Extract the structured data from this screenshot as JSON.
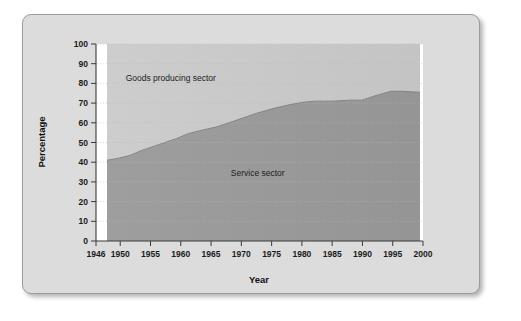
{
  "figure": {
    "panel_background": "#dcdcdc",
    "panel_border": "#9b9b9b",
    "page_background": "#ffffff"
  },
  "chart_data": {
    "type": "area",
    "stacked": true,
    "title": "",
    "subtitle": "",
    "xlabel": "Year",
    "ylabel": "Percentage",
    "xlim": [
      1946,
      2000
    ],
    "ylim": [
      0,
      100
    ],
    "grid": true,
    "grid_style": "dotted-horizontal",
    "legend_position": "inline-annotations",
    "plot_background": "#c9c9c9",
    "x": [
      1946,
      1948,
      1950,
      1952,
      1955,
      1958,
      1960,
      1962,
      1965,
      1968,
      1970,
      1972,
      1975,
      1978,
      1980,
      1982,
      1985,
      1988,
      1990,
      1992,
      1995,
      1997,
      2000
    ],
    "xticks": [
      1946,
      1950,
      1955,
      1960,
      1965,
      1970,
      1975,
      1980,
      1985,
      1990,
      1995,
      2000
    ],
    "xticklabels": [
      "1946",
      "1950",
      "1955",
      "1960",
      "1965",
      "1970",
      "1975",
      "1980",
      "1985",
      "1990",
      "1995",
      "2000"
    ],
    "yticks": [
      0,
      10,
      20,
      30,
      40,
      50,
      60,
      70,
      80,
      90,
      100
    ],
    "yticklabels": [
      "0",
      "10",
      "20",
      "30",
      "40",
      "50",
      "60",
      "70",
      "80",
      "90",
      "100"
    ],
    "series": [
      {
        "name": "Service sector",
        "color": "#9a9a9a",
        "label_text": "Service sector",
        "label_x": 1972,
        "label_y": 33,
        "values": [
          41,
          42,
          43.5,
          46,
          49,
          52,
          54.5,
          56,
          58,
          61,
          63,
          65,
          67.5,
          69.5,
          70.5,
          71,
          71,
          71.5,
          71.5,
          73.5,
          76,
          76,
          75.5
        ]
      },
      {
        "name": "Goods producing sector",
        "color": "#c9c9c9",
        "label_text": "Goods producing sector",
        "label_x": 1957,
        "label_y": 81,
        "values": [
          59,
          58,
          56.5,
          54,
          51,
          48,
          45.5,
          44,
          42,
          39,
          37,
          35,
          32.5,
          30.5,
          29.5,
          29,
          29,
          28.5,
          28.5,
          26.5,
          24,
          24,
          24.5
        ]
      }
    ]
  }
}
